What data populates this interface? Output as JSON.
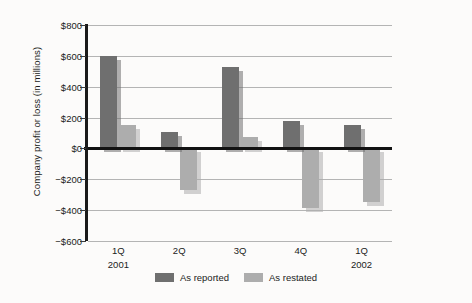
{
  "chart_data": {
    "type": "bar",
    "title": "",
    "subtitle": "",
    "xlabel": "",
    "ylabel": "Company profit or loss (in millions)",
    "categories": [
      "1Q",
      "2Q",
      "3Q",
      "4Q",
      "1Q"
    ],
    "category_years": [
      "2001",
      "",
      "",
      "",
      "2002"
    ],
    "series": [
      {
        "name": "As reported",
        "color": "#6f6f6f",
        "values": [
          600,
          105,
          530,
          180,
          150
        ]
      },
      {
        "name": "As restated",
        "color": "#adadad",
        "values": [
          150,
          -270,
          75,
          -385,
          -350
        ]
      }
    ],
    "ylim": [
      -600,
      800
    ],
    "ytick_values": [
      800,
      600,
      400,
      200,
      0,
      -200,
      -400,
      -600
    ],
    "ytick_labels": [
      "$800",
      "$600",
      "$400",
      "$200",
      "$0",
      "−$200",
      "−$400",
      "−$600"
    ],
    "grid": true,
    "grid_axis": "y",
    "legend_position": "bottom-center",
    "zero_line": true,
    "zero_line_color": "#121212",
    "gridline_color": "#b4b4b4",
    "background_color": "#fcfbfa",
    "bar_style": "drop-shadow-offset"
  },
  "legend": {
    "items": [
      {
        "label": "As reported",
        "color": "#6f6f6f",
        "swatch_name": "legend-swatch-as-reported"
      },
      {
        "label": "As restated",
        "color": "#adadad",
        "swatch_name": "legend-swatch-as-restated"
      }
    ]
  }
}
